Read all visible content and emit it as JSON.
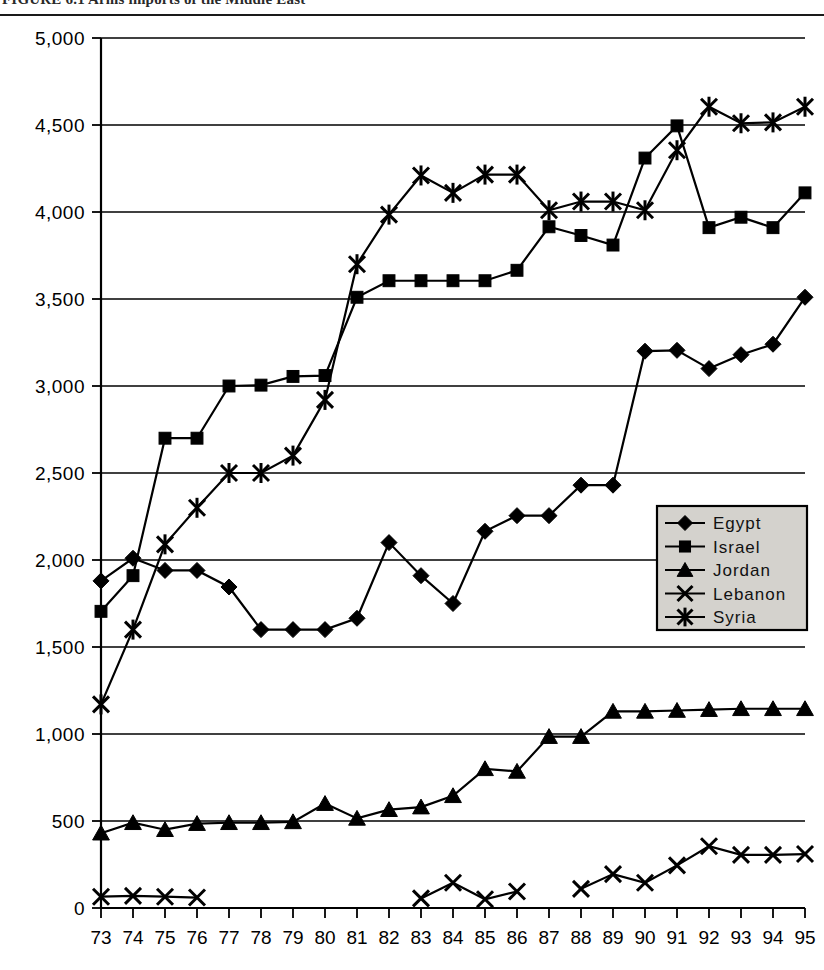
{
  "figure": {
    "title_partial": "FIGURE 6.1   Arms imports of the Middle East",
    "title_visible_note": "top of title row is cropped"
  },
  "chart_data": {
    "type": "line",
    "title": "",
    "xlabel": "",
    "ylabel": "",
    "x": [
      "73",
      "74",
      "75",
      "76",
      "77",
      "78",
      "79",
      "80",
      "81",
      "82",
      "83",
      "84",
      "85",
      "86",
      "87",
      "88",
      "89",
      "90",
      "91",
      "92",
      "93",
      "94",
      "95"
    ],
    "xlim": [
      73,
      95
    ],
    "ylim": [
      0,
      5000
    ],
    "yticks": [
      0,
      500,
      1000,
      1500,
      2000,
      2500,
      3000,
      3500,
      4000,
      4500,
      5000
    ],
    "ytick_labels": [
      "0",
      "500",
      "1,000",
      "1,500",
      "2,000",
      "2,500",
      "3,000",
      "3,500",
      "4,000",
      "4,500",
      "5,000"
    ],
    "xtick_labels": [
      "73",
      "74",
      "75",
      "76",
      "77",
      "78",
      "79",
      "80",
      "81",
      "82",
      "83",
      "84",
      "85",
      "86",
      "87",
      "88",
      "89",
      "90",
      "91",
      "92",
      "93",
      "94",
      "95"
    ],
    "grid": true,
    "grid_axis": "y",
    "legend_position": "center-right",
    "series": [
      {
        "name": "Egypt",
        "marker": "diamond",
        "values": [
          1880,
          2010,
          1940,
          1940,
          1845,
          1600,
          1600,
          1600,
          1665,
          2100,
          1910,
          1750,
          2165,
          2255,
          2255,
          2430,
          2430,
          3200,
          3205,
          3100,
          3180,
          3240,
          3510
        ]
      },
      {
        "name": "Israel",
        "marker": "square",
        "values": [
          1705,
          1910,
          2700,
          2700,
          3000,
          3005,
          3055,
          3060,
          3510,
          3605,
          3605,
          3605,
          3605,
          3665,
          3915,
          3865,
          3810,
          4310,
          4495,
          3910,
          3970,
          3910,
          4110
        ]
      },
      {
        "name": "Jordan",
        "marker": "triangle",
        "values": [
          430,
          490,
          450,
          485,
          490,
          490,
          495,
          600,
          515,
          565,
          580,
          645,
          800,
          785,
          985,
          985,
          1130,
          1130,
          1135,
          1140,
          1145,
          1145,
          1145
        ]
      },
      {
        "name": "Lebanon",
        "marker": "x",
        "values": [
          65,
          70,
          65,
          60,
          null,
          null,
          null,
          null,
          null,
          null,
          55,
          145,
          50,
          95,
          null,
          110,
          195,
          145,
          245,
          355,
          305,
          305,
          310
        ]
      },
      {
        "name": "Syria",
        "marker": "asterisk",
        "values": [
          1170,
          1600,
          2090,
          2300,
          2500,
          2500,
          2600,
          2920,
          3700,
          3985,
          4210,
          4110,
          4215,
          4215,
          4010,
          4060,
          4060,
          4010,
          4355,
          4605,
          4510,
          4515,
          4605
        ]
      }
    ],
    "legend_entries": [
      "Egypt",
      "Israel",
      "Jordan",
      "Lebanon",
      "Syria"
    ],
    "colors": {
      "series": "#000000",
      "grid": "#000000",
      "axis": "#000000",
      "legend_background": "#d4d2cd",
      "page_background": "#ffffff"
    }
  }
}
